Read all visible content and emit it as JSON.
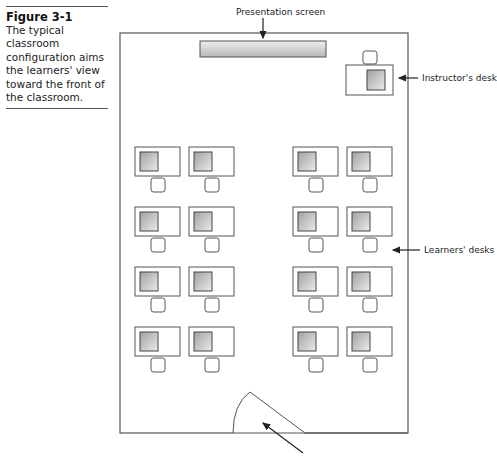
{
  "caption": {
    "title": "Figure 3-1",
    "text": "The typical classroom configuration aims the learners' view toward the front of the classroom."
  },
  "labels": {
    "presentation_screen": "Presentation screen",
    "instructors_desk": "Instructor's desk",
    "learners_desks": "Learners' desks"
  },
  "layout": {
    "room": {
      "x": 120,
      "y": 33,
      "w": 288,
      "h": 400
    },
    "screen": {
      "x": 200,
      "y": 41,
      "w": 126,
      "h": 16
    },
    "instructor": {
      "desk": {
        "x": 346,
        "y": 65,
        "w": 47,
        "h": 30
      },
      "monitor": {
        "x": 367,
        "y": 70,
        "w": 18,
        "h": 20
      },
      "chair": {
        "x": 363,
        "y": 51,
        "w": 14,
        "h": 13
      }
    },
    "learner_columns_x": [
      135,
      189,
      293,
      347
    ],
    "learner_rows_y": [
      147,
      207,
      267,
      327
    ],
    "desk_size": {
      "w": 45,
      "h": 29
    },
    "door": {
      "apex": [
        250,
        392
      ],
      "end": [
        305,
        433
      ],
      "arc_end": [
        233,
        433
      ]
    }
  },
  "colors": {
    "line": "#555555",
    "monitor_light": "#e6e6e6",
    "monitor_dark": "#9a9a9a"
  }
}
